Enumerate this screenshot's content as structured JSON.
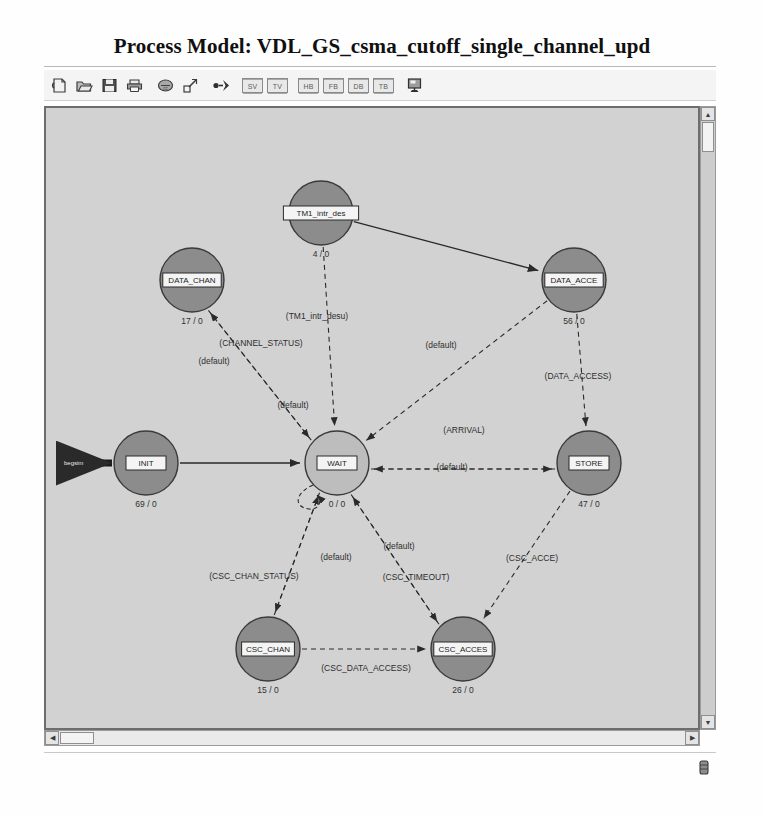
{
  "window": {
    "title": "Process Model: VDL_GS_csma_cutoff_single_channel_upd"
  },
  "toolbar": {
    "buttons": [
      {
        "name": "new-model-icon",
        "label": ""
      },
      {
        "name": "open-model-icon",
        "label": ""
      },
      {
        "name": "save-model-icon",
        "label": ""
      },
      {
        "name": "print-model-icon",
        "label": ""
      },
      {
        "name": "compile-icon",
        "label": ""
      },
      {
        "name": "zoom-expand-icon",
        "label": ""
      },
      {
        "name": "create-transition-icon",
        "label": ""
      }
    ],
    "label_buttons": [
      {
        "name": "state-variables-button",
        "label": "SV"
      },
      {
        "name": "temporary-variables-button",
        "label": "TV"
      },
      {
        "name": "header-block-button",
        "label": "HB"
      },
      {
        "name": "function-block-button",
        "label": "FB"
      },
      {
        "name": "diagnostic-block-button",
        "label": "DB"
      },
      {
        "name": "termination-block-button",
        "label": "TB"
      }
    ],
    "last_button": {
      "name": "model-attributes-button",
      "label": ""
    }
  },
  "scrollbars": {
    "vertical": {
      "up": "▲",
      "down": "▼"
    },
    "horizontal": {
      "left": "◀",
      "right": "▶"
    }
  },
  "diagram": {
    "entry_marker": "begsim",
    "nodes": [
      {
        "id": "TM1",
        "name": "TM1_intr_des",
        "count": "4 / 0",
        "cx": 275,
        "cy": 105,
        "r": 32,
        "fill": "#8c8c8c"
      },
      {
        "id": "DATA_CHAN",
        "name": "DATA_CHAN",
        "count": "17 / 0",
        "cx": 146,
        "cy": 172,
        "r": 32,
        "fill": "#8c8c8c"
      },
      {
        "id": "DATA_ACCE",
        "name": "DATA_ACCE",
        "count": "56 / 0",
        "cx": 528,
        "cy": 172,
        "r": 32,
        "fill": "#8c8c8c"
      },
      {
        "id": "INIT",
        "name": "INIT",
        "count": "69 / 0",
        "cx": 100,
        "cy": 355,
        "r": 32,
        "fill": "#8c8c8c"
      },
      {
        "id": "WAIT",
        "name": "WAIT",
        "count": "0 / 0",
        "cx": 291,
        "cy": 355,
        "r": 32,
        "fill": "#bdbdbd"
      },
      {
        "id": "STORE",
        "name": "STORE",
        "count": "47 / 0",
        "cx": 543,
        "cy": 355,
        "r": 32,
        "fill": "#8c8c8c"
      },
      {
        "id": "CSC_CHAN",
        "name": "CSC_CHAN",
        "count": "15 / 0",
        "cx": 222,
        "cy": 541,
        "r": 32,
        "fill": "#8c8c8c"
      },
      {
        "id": "CSC_ACCES",
        "name": "CSC_ACCES",
        "count": "26 / 0",
        "cx": 417,
        "cy": 541,
        "r": 32,
        "fill": "#8c8c8c"
      }
    ],
    "edges": [
      {
        "from": "INIT",
        "to": "WAIT",
        "label": "",
        "style": "solid"
      },
      {
        "from": "TM1",
        "to": "DATA_ACCE",
        "label": "",
        "style": "solid"
      },
      {
        "from": "DATA_CHAN",
        "to": "WAIT",
        "label": "(default)",
        "style": "dashed"
      },
      {
        "from": "WAIT",
        "to": "DATA_CHAN",
        "label": "(CHANNEL_STATUS)",
        "style": "dashed"
      },
      {
        "from": "TM1",
        "to": "WAIT",
        "label": "(TM1_intr_desu)",
        "style": "dashed"
      },
      {
        "from": "DATA_ACCE",
        "to": "WAIT",
        "label": "(default)",
        "style": "dashed"
      },
      {
        "from": "DATA_ACCE",
        "to": "STORE",
        "label": "(DATA_ACCESS)",
        "style": "dashed"
      },
      {
        "from": "WAIT",
        "to": "STORE",
        "label": "(ARRIVAL)",
        "style": "dashed"
      },
      {
        "from": "STORE",
        "to": "WAIT",
        "label": "(default)",
        "style": "dashed"
      },
      {
        "from": "WAIT",
        "to": "CSC_CHAN",
        "label": "(CSC_CHAN_STATUS)",
        "style": "dashed"
      },
      {
        "from": "CSC_CHAN",
        "to": "WAIT",
        "label": "(default)",
        "style": "dashed"
      },
      {
        "from": "WAIT",
        "to": "CSC_ACCES",
        "label": "(CSC_TIMEOUT)",
        "style": "dashed"
      },
      {
        "from": "CSC_ACCES",
        "to": "WAIT",
        "label": "(default)",
        "style": "dashed"
      },
      {
        "from": "STORE",
        "to": "CSC_ACCES",
        "label": "(CSC_ACCE)",
        "style": "dashed"
      },
      {
        "from": "CSC_CHAN",
        "to": "CSC_ACCES",
        "label": "(CSC_DATA_ACCESS)",
        "style": "dashed"
      },
      {
        "from": "WAIT",
        "to": "WAIT",
        "label": "",
        "style": "dashed"
      }
    ],
    "edge_labels": [
      {
        "text": "(TM1_intr_desu)",
        "x": 271,
        "y": 211,
        "anchor": "middle"
      },
      {
        "text": "(CHANNEL_STATUS)",
        "x": 215,
        "y": 238,
        "anchor": "middle"
      },
      {
        "text": "(default)",
        "x": 168,
        "y": 256,
        "anchor": "middle"
      },
      {
        "text": "(default)",
        "x": 247,
        "y": 300,
        "anchor": "middle"
      },
      {
        "text": "(default)",
        "x": 395,
        "y": 240,
        "anchor": "middle"
      },
      {
        "text": "(DATA_ACCESS)",
        "x": 532,
        "y": 271,
        "anchor": "middle"
      },
      {
        "text": "(ARRIVAL)",
        "x": 418,
        "y": 325,
        "anchor": "middle"
      },
      {
        "text": "(default)",
        "x": 406,
        "y": 362,
        "anchor": "middle"
      },
      {
        "text": "(CSC_CHAN_STATUS)",
        "x": 208,
        "y": 471,
        "anchor": "middle"
      },
      {
        "text": "(default)",
        "x": 290,
        "y": 452,
        "anchor": "middle"
      },
      {
        "text": "(CSC_TIMEOUT)",
        "x": 370,
        "y": 472,
        "anchor": "middle"
      },
      {
        "text": "(default)",
        "x": 353,
        "y": 441,
        "anchor": "middle"
      },
      {
        "text": "(CSC_ACCE)",
        "x": 486,
        "y": 453,
        "anchor": "middle"
      },
      {
        "text": "(CSC_DATA_ACCESS)",
        "x": 320,
        "y": 563,
        "anchor": "middle"
      }
    ]
  }
}
